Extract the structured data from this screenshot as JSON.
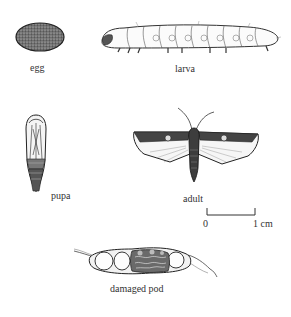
{
  "figure": {
    "type": "insect-life-cycle-illustration",
    "stages": [
      {
        "id": "egg",
        "label": "egg"
      },
      {
        "id": "larva",
        "label": "larva"
      },
      {
        "id": "pupa",
        "label": "pupa"
      },
      {
        "id": "adult",
        "label": "adult"
      },
      {
        "id": "damaged-pod",
        "label": "damaged pod"
      }
    ],
    "scale_bar": {
      "start_label": "0",
      "end_label": "1 cm"
    }
  }
}
